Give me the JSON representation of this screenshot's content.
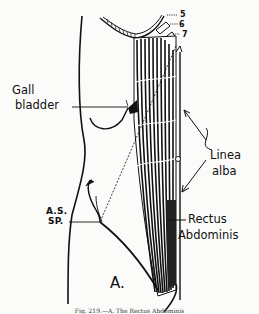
{
  "figure": {
    "panel_label": "A.",
    "labels": {
      "rib_5": "5",
      "rib_6": "6",
      "rib_7": "7",
      "gall_bladder_line1": "Gall",
      "gall_bladder_line2": "bladder",
      "linea_alba_line1": "Linea",
      "linea_alba_line2": "alba",
      "asis_line1": "A.S.",
      "asis_line2": "SP.",
      "rectus_line1": "Rectus",
      "rectus_line2": "Abdominis"
    },
    "caption": "Fig. 219.—A. The Rectus Abdominis"
  },
  "colors": {
    "ink": "#111111",
    "paper": "#fbfbfa"
  }
}
